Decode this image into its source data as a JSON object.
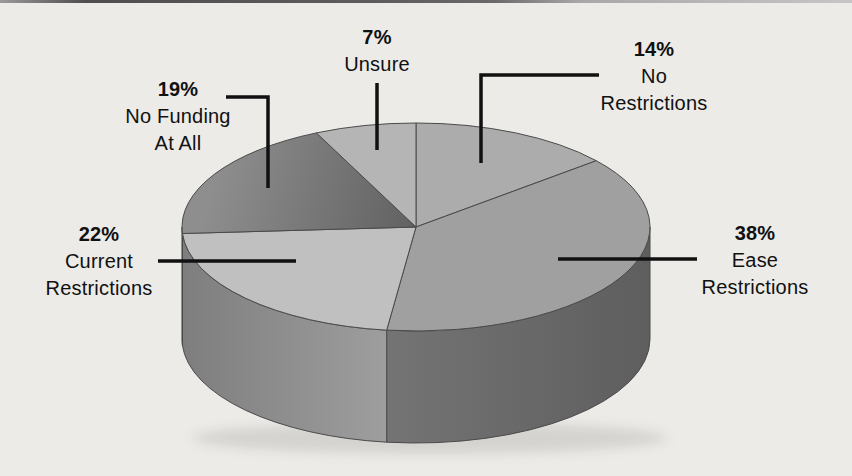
{
  "page": {
    "background_color": "#ecebe8",
    "top_border": {
      "dark_color": "#4f4f4f",
      "light_color": "#c6c6c6"
    },
    "text_color": "#111111",
    "leader_line_color": "#111111",
    "slice_outline_color": "#4a4a4a"
  },
  "chart_data": {
    "type": "pie",
    "style": "3d",
    "title": "",
    "unit": "%",
    "total": 100,
    "start_angle_deg_clockwise_from_top": 0,
    "legend": "none",
    "categories": [
      "No Restrictions",
      "Ease Restrictions",
      "Current Restrictions",
      "No Funding At All",
      "Unsure"
    ],
    "values": [
      14,
      38,
      22,
      19,
      7
    ],
    "slices": [
      {
        "id": "no-restrictions",
        "label": "No Restrictions",
        "value": 14,
        "pct_label": "14%",
        "label_lines": [
          "No",
          "Restrictions"
        ],
        "top_color": "#acacac",
        "side_left": "",
        "side_right": ""
      },
      {
        "id": "ease-restrictions",
        "label": "Ease Restrictions",
        "value": 38,
        "pct_label": "38%",
        "label_lines": [
          "Ease",
          "Restrictions"
        ],
        "top_color": "#a0a0a0",
        "side_left": "#747474",
        "side_right": "#5e5e5e"
      },
      {
        "id": "current-restrictions",
        "label": "Current Restrictions",
        "value": 22,
        "pct_label": "22%",
        "label_lines": [
          "Current",
          "Restrictions"
        ],
        "top_color": "#c0c0c0",
        "side_left": "#7e7e7e",
        "side_right": "#9e9e9e"
      },
      {
        "id": "no-funding-at-all",
        "label": "No Funding At All",
        "value": 19,
        "pct_label": "19%",
        "label_lines": [
          "No Funding",
          "At All"
        ],
        "top_color": "#616161",
        "top_color2": "#8e8e8e",
        "side_left": "#565656",
        "side_right": "#565656"
      },
      {
        "id": "unsure",
        "label": "Unsure",
        "value": 7,
        "pct_label": "7%",
        "label_lines": [
          "Unsure"
        ],
        "top_color": "#b5b5b5",
        "side_left": "",
        "side_right": ""
      }
    ]
  }
}
